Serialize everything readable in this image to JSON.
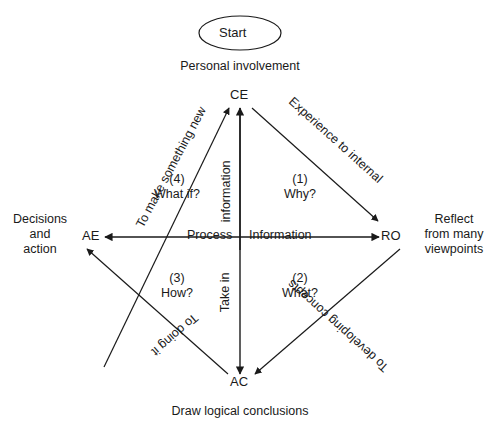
{
  "diagram": {
    "title_node": {
      "label": "Start",
      "shape": "ellipse"
    },
    "nodes": [
      {
        "id": "CE",
        "label": "CE",
        "x": 240,
        "y": 97,
        "outer_label": "Personal involvement"
      },
      {
        "id": "AE",
        "label": "AE",
        "x": 93,
        "y": 237,
        "outer_label": "Decisions and action"
      },
      {
        "id": "RO",
        "label": "RO",
        "x": 390,
        "y": 237,
        "outer_label": "Reflect from many viewpoints"
      },
      {
        "id": "AC",
        "label": "AC",
        "x": 240,
        "y": 384,
        "outer_label": "Draw logical conclusions"
      }
    ],
    "outer_labels": {
      "top": "Personal involvement",
      "left_line1": "Decisions",
      "left_line2": "and",
      "left_line3": "action",
      "right_line1": "Reflect",
      "right_line2": "from many",
      "right_line3": "viewpoints",
      "bottom": "Draw logical conclusions"
    },
    "edge_labels": {
      "top_right": "Experience to internal",
      "top_left": "To make something new",
      "bottom_left": "To doing it",
      "bottom_right": "To developing concepts"
    },
    "axis_labels": {
      "horizontal_left": "Process",
      "horizontal_right": "Information",
      "vertical_upper": "information",
      "vertical_lower": "Take in"
    },
    "quadrants": [
      {
        "id": "q1",
        "number": "(1)",
        "question": "Why?",
        "position": "upper-right"
      },
      {
        "id": "q2",
        "number": "(2)",
        "question": "What?",
        "position": "lower-right"
      },
      {
        "id": "q3",
        "number": "(3)",
        "question": "How?",
        "position": "lower-left"
      },
      {
        "id": "q4",
        "number": "(4)",
        "question": "What if?",
        "position": "upper-left"
      }
    ],
    "colors": {
      "stroke": "#1a1a1a",
      "background": "#ffffff",
      "text": "#1a1a1a"
    }
  }
}
